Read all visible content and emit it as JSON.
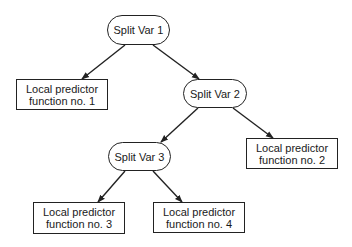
{
  "diagram": {
    "type": "decision-tree",
    "colors": {
      "stroke": "#222222",
      "text": "#1a1a1a",
      "background": "#ffffff"
    },
    "nodes": {
      "split1": {
        "label": "Split Var 1",
        "shape": "rounded"
      },
      "split2": {
        "label": "Split Var 2",
        "shape": "rounded"
      },
      "split3": {
        "label": "Split Var 3",
        "shape": "rounded"
      },
      "leaf1": {
        "line1": "Local predictor",
        "line2": "function no. 1",
        "shape": "rectangle"
      },
      "leaf2": {
        "line1": "Local predictor",
        "line2": "function no. 2",
        "shape": "rectangle"
      },
      "leaf3": {
        "line1": "Local predictor",
        "line2": "function no. 3",
        "shape": "rectangle"
      },
      "leaf4": {
        "line1": "Local predictor",
        "line2": "function no. 4",
        "shape": "rectangle"
      }
    },
    "edges": [
      {
        "from": "split1",
        "to": "leaf1"
      },
      {
        "from": "split1",
        "to": "split2"
      },
      {
        "from": "split2",
        "to": "split3"
      },
      {
        "from": "split2",
        "to": "leaf2"
      },
      {
        "from": "split3",
        "to": "leaf3"
      },
      {
        "from": "split3",
        "to": "leaf4"
      }
    ]
  }
}
